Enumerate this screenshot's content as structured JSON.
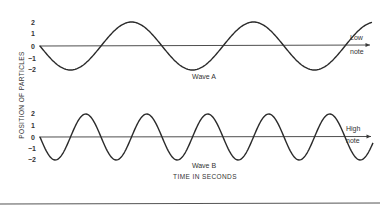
{
  "figure": {
    "y_axis_label": "POSITION OF PARTICLES",
    "x_axis_label": "TIME IN SECONDS",
    "panels": [
      {
        "id": "wave-a",
        "caption": "Wave A",
        "note_line1": "Low",
        "note_line2": "note",
        "y_ticks": [
          "2",
          "1",
          "0",
          "−1",
          "−2"
        ],
        "axis_y": 46,
        "amplitude_px": 24,
        "period_px": 122,
        "x_start": 40,
        "x_end": 372,
        "phase": "starts at 0 going negative"
      },
      {
        "id": "wave-b",
        "caption": "Wave B",
        "note_line1": "High",
        "note_line2": "note",
        "y_ticks": [
          "2",
          "1",
          "0",
          "−1",
          "−2"
        ],
        "axis_y": 137,
        "amplitude_px": 23,
        "period_px": 61,
        "x_start": 40,
        "x_end": 373,
        "phase": "starts at 0 going negative"
      }
    ]
  },
  "chart_data": [
    {
      "type": "line",
      "title": "Wave A",
      "annotation": "Low note",
      "xlabel": "TIME IN SECONDS",
      "ylabel": "POSITION OF PARTICLES",
      "ylim": [
        -2,
        2
      ],
      "y_ticks": [
        2,
        1,
        0,
        -1,
        -2
      ],
      "description": "Sine wave, amplitude 2, approx. 2.7 cycles across the time axis, starting at 0 and dipping to -2 first",
      "cycles": 2.72
    },
    {
      "type": "line",
      "title": "Wave B",
      "annotation": "High note",
      "xlabel": "TIME IN SECONDS",
      "ylabel": "POSITION OF PARTICLES",
      "ylim": [
        -2,
        2
      ],
      "y_ticks": [
        2,
        1,
        0,
        -1,
        -2
      ],
      "description": "Sine wave, amplitude 2, same amplitude as Wave A but twice the frequency (approx. 5.5 cycles), starting at 0 and dipping to -2 first",
      "cycles": 5.46
    }
  ]
}
